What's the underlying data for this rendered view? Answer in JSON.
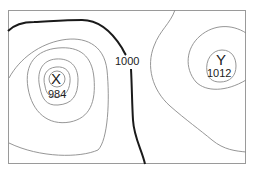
{
  "diagram": {
    "type": "isobar-map",
    "frame_color": "#9a9a9a",
    "contour_color": "#8a8a8a",
    "highlight_contour_color": "#1a1a1a",
    "centers": [
      {
        "id": "X",
        "label": "X",
        "value": "984"
      },
      {
        "id": "Y",
        "label": "Y",
        "value": "1012"
      }
    ],
    "isobar_labels": [
      {
        "value": "1000"
      }
    ]
  }
}
